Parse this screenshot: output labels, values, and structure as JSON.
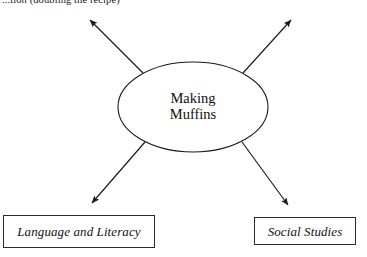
{
  "page": {
    "width": 367,
    "height": 257,
    "background_color": "#ffffff",
    "ink_color": "#19191b"
  },
  "header": {
    "clipped_text": "...tion (doubling the recipe)"
  },
  "diagram": {
    "type": "concept-map",
    "center_node": {
      "shape": "ellipse",
      "line_1": "Making",
      "line_2": "Muffins",
      "stroke_color": "#1a1a1c",
      "fill_color": "#ffffff"
    },
    "connectors": [
      {
        "name": "arrow-top-left",
        "direction": "up-left",
        "arrowhead": "solid-triangle",
        "target": "off-screen"
      },
      {
        "name": "arrow-top-right",
        "direction": "up-right",
        "arrowhead": "solid-triangle",
        "target": "off-screen"
      },
      {
        "name": "arrow-bottom-left",
        "direction": "down-left",
        "arrowhead": "solid-triangle",
        "target": "language-and-literacy"
      },
      {
        "name": "arrow-bottom-right",
        "direction": "down-right",
        "arrowhead": "solid-triangle",
        "target": "social-studies"
      }
    ],
    "topic_boxes": [
      {
        "id": "language-and-literacy",
        "label": "Language and Literacy",
        "style": "italic",
        "border_color": "#2b2b2d"
      },
      {
        "id": "social-studies",
        "label": "Social Studies",
        "style": "italic",
        "border_color": "#2b2b2d"
      }
    ]
  }
}
